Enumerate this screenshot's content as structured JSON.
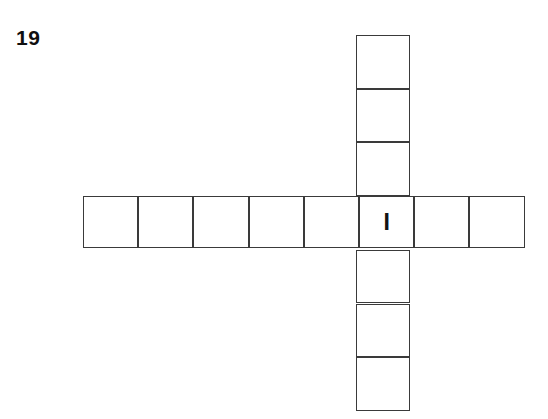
{
  "puzzle": {
    "number_label": "19",
    "type": "crossword-cross-grid",
    "background_color": "#ffffff",
    "line_color": "#3a3a3a",
    "text_color": "#141414",
    "across": {
      "cell_count": 8,
      "start_x": 83,
      "y": 196,
      "cell_width": 55.2,
      "cell_height": 52,
      "letters": [
        "",
        "",
        "",
        "",
        "",
        "I",
        "",
        ""
      ]
    },
    "down": {
      "cell_count": 7,
      "x": 356,
      "start_y": 35,
      "cell_width": 54,
      "cell_height": 53.7,
      "intersection_index": 3,
      "letters": [
        "",
        "",
        "",
        "I",
        "",
        "",
        ""
      ]
    },
    "intersection": {
      "letter": "I",
      "across_index": 5,
      "down_index": 3
    }
  }
}
